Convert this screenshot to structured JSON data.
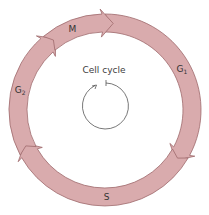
{
  "diagram": {
    "title": "Cell cycle",
    "center": {
      "x": 105,
      "y": 110
    },
    "outer_radius": 96,
    "inner_radius": 78,
    "fill_color": "#d9abad",
    "stroke_color": "#9e6a6c",
    "phases": [
      {
        "id": "G1",
        "label": "G",
        "subscript": "1",
        "start_deg": 0,
        "end_deg": 120
      },
      {
        "id": "S",
        "label": "S",
        "subscript": "",
        "start_deg": 120,
        "end_deg": 242
      },
      {
        "id": "G2",
        "label": "G",
        "subscript": "2",
        "start_deg": 242,
        "end_deg": 320
      },
      {
        "id": "M",
        "label": "M",
        "subscript": "",
        "start_deg": 320,
        "end_deg": 360
      }
    ],
    "inner_cycle_icon": "circular-arrow-icon"
  }
}
